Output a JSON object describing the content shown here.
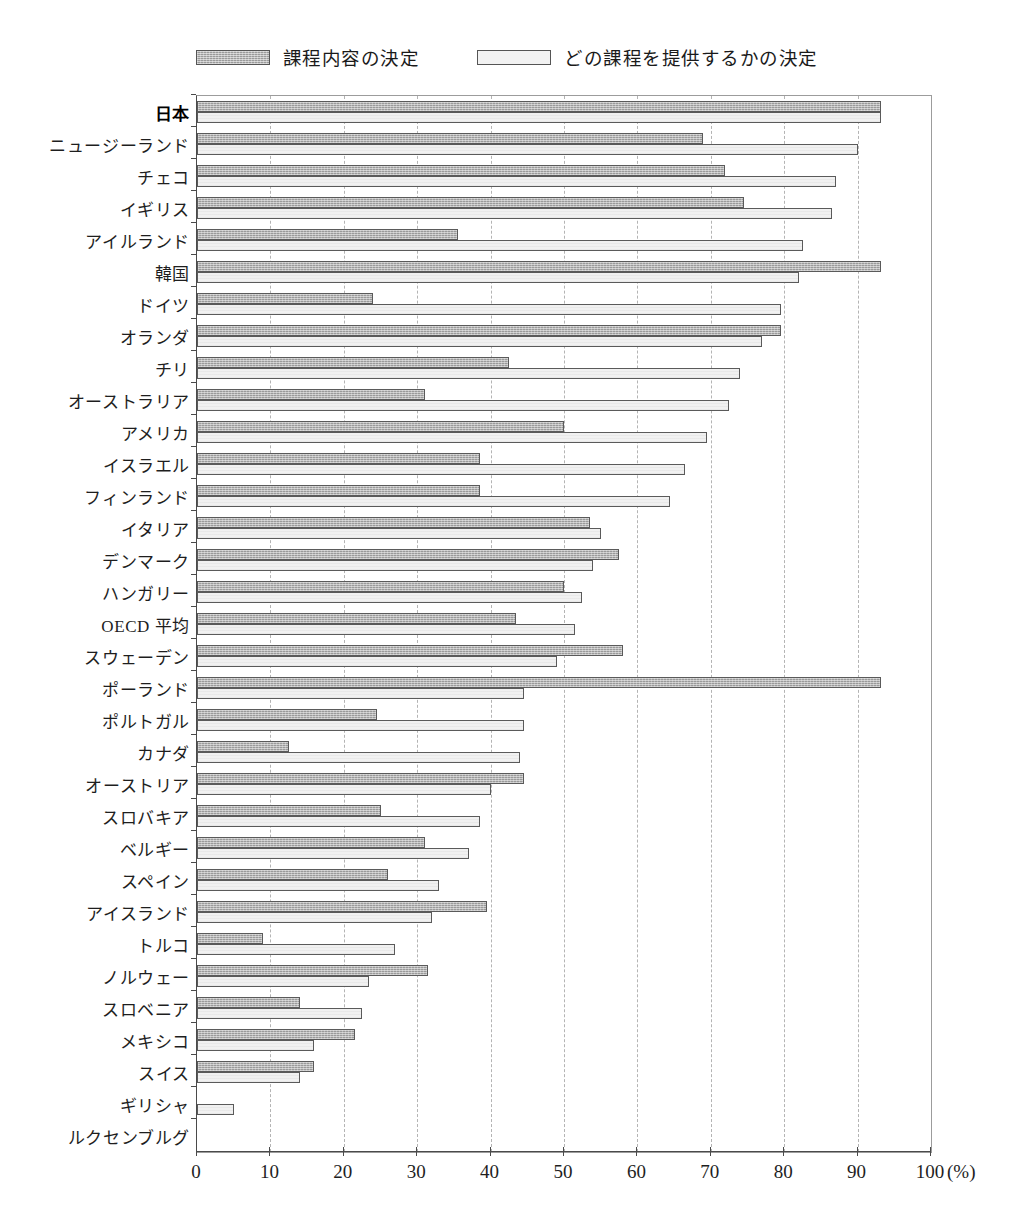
{
  "chart_data": {
    "type": "bar",
    "orientation": "horizontal",
    "title": "",
    "xlabel": "(%)",
    "ylabel": "",
    "xlim": [
      0,
      100
    ],
    "xticks": [
      0,
      10,
      20,
      30,
      40,
      50,
      60,
      70,
      80,
      90,
      100
    ],
    "xtick_labels": [
      "0",
      "10",
      "20",
      "30",
      "40",
      "50",
      "60",
      "70",
      "80",
      "90",
      "100"
    ],
    "unit_label": "(%)",
    "grid": "vertical-dashed",
    "legend_position": "top-center",
    "colors": {
      "dark": "#9a9a9a",
      "light": "#f1f1f1",
      "border": "#5a5a5a",
      "grid": "#b4b4b4",
      "axis": "#4a4a4a"
    },
    "series": [
      {
        "name": "課程内容の決定",
        "style": "dark",
        "values": [
          93.2,
          69.0,
          72.0,
          74.5,
          35.5,
          93.2,
          24.0,
          79.5,
          42.5,
          31.0,
          50.0,
          38.5,
          38.5,
          53.5,
          57.5,
          50.0,
          43.5,
          58.0,
          93.2,
          24.5,
          12.5,
          44.5,
          25.0,
          31.0,
          26.0,
          39.5,
          9.0,
          31.5,
          14.0,
          21.5,
          16.0,
          0.0,
          0.0
        ]
      },
      {
        "name": "どの課程を提供するかの決定",
        "style": "light",
        "values": [
          93.2,
          90.0,
          87.0,
          86.5,
          82.5,
          82.0,
          79.5,
          77.0,
          74.0,
          72.5,
          69.5,
          66.5,
          64.5,
          55.0,
          54.0,
          52.5,
          51.5,
          49.0,
          44.5,
          44.5,
          44.0,
          40.0,
          38.5,
          37.0,
          33.0,
          32.0,
          27.0,
          23.5,
          22.5,
          16.0,
          14.0,
          5.0,
          0.0
        ]
      }
    ],
    "categories": [
      "日本",
      "ニュージーランド",
      "チェコ",
      "イギリス",
      "アイルランド",
      "韓国",
      "ドイツ",
      "オランダ",
      "チリ",
      "オーストラリア",
      "アメリカ",
      "イスラエル",
      "フィンランド",
      "イタリア",
      "デンマーク",
      "ハンガリー",
      "OECD 平均",
      "スウェーデン",
      "ポーランド",
      "ポルトガル",
      "カナダ",
      "オーストリア",
      "スロバキア",
      "ベルギー",
      "スペイン",
      "アイスランド",
      "トルコ",
      "ノルウェー",
      "スロベニア",
      "メキシコ",
      "スイス",
      "ギリシャ",
      "ルクセンブルグ"
    ],
    "highlight_category": "日本"
  },
  "legend": {
    "items": [
      {
        "label": "課程内容の決定",
        "swatch": "dark-hatched-swatch"
      },
      {
        "label": "どの課程を提供するかの決定",
        "swatch": "light-swatch"
      }
    ]
  }
}
